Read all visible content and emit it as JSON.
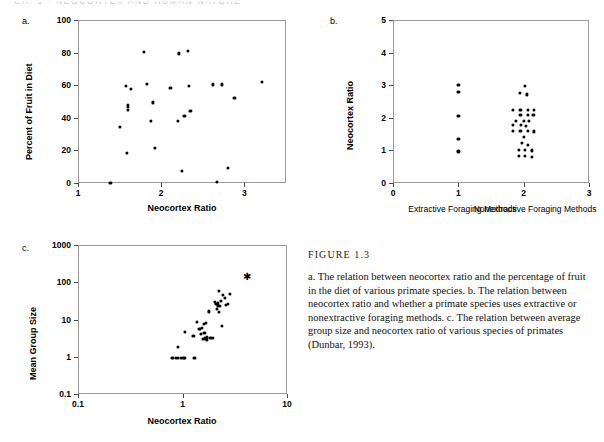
{
  "page_header": "CH. 1 · NEOCORTEX AND HUMAN NATURE",
  "figure": {
    "title": "FIGURE 1.3",
    "caption": "a. The relation between neocortex ratio and the percentage of fruit in the diet of various primate species. b. The relation between neocortex ratio and whether a primate species uses extractive or nonextractive foraging methods. c. The relation between average group size and neocortex ratio of various species of primates (Dunbar, 1993)."
  },
  "panels": {
    "a": {
      "letter": "a."
    },
    "b": {
      "letter": "b."
    },
    "c": {
      "letter": "c."
    }
  },
  "chart_data": [
    {
      "id": "a",
      "type": "scatter",
      "title": "",
      "xlabel": "Neocortex Ratio",
      "ylabel": "Percent of Fruit in Diet",
      "xlim": [
        1,
        3.5
      ],
      "ylim": [
        0,
        100
      ],
      "xscale": "linear",
      "yscale": "linear",
      "xticks": [
        1,
        2,
        3
      ],
      "xticklabels": [
        "1",
        "2",
        "3"
      ],
      "yticks": [
        0,
        20,
        40,
        60,
        80,
        100
      ],
      "yticklabels": [
        "0",
        "20",
        "40",
        "60",
        "80",
        "100"
      ],
      "grid": false,
      "legend": null,
      "points": [
        [
          1.39,
          0.0
        ],
        [
          1.5,
          34.5
        ],
        [
          1.58,
          59.5
        ],
        [
          1.59,
          18.5
        ],
        [
          1.6,
          48.0
        ],
        [
          1.6,
          46.5
        ],
        [
          1.6,
          45.0
        ],
        [
          1.64,
          57.5
        ],
        [
          1.79,
          80.5
        ],
        [
          1.83,
          61.0
        ],
        [
          1.88,
          38.0
        ],
        [
          1.9,
          49.5
        ],
        [
          1.92,
          21.5
        ],
        [
          2.11,
          58.5
        ],
        [
          2.2,
          38.0
        ],
        [
          2.21,
          79.5
        ],
        [
          2.25,
          7.5
        ],
        [
          2.28,
          41.0
        ],
        [
          2.32,
          81.0
        ],
        [
          2.35,
          44.0
        ],
        [
          2.33,
          59.5
        ],
        [
          2.62,
          60.5
        ],
        [
          2.67,
          0.8
        ],
        [
          2.73,
          60.5
        ],
        [
          2.8,
          9.5
        ],
        [
          2.88,
          52.0
        ],
        [
          3.21,
          62.0
        ]
      ]
    },
    {
      "id": "b",
      "type": "scatter",
      "title": "",
      "xlabel": "",
      "ylabel": "Neocortex Ratio",
      "xlim": [
        0,
        3
      ],
      "ylim": [
        0,
        5
      ],
      "xscale": "linear",
      "yscale": "linear",
      "xticks": [
        0,
        1,
        2,
        3
      ],
      "xticklabels": [
        "0",
        "1",
        "2",
        "3"
      ],
      "yticks": [
        0,
        1,
        2,
        3,
        4,
        5
      ],
      "yticklabels": [
        "0",
        "1",
        "2",
        "3",
        "4",
        "5"
      ],
      "grid": false,
      "legend": null,
      "categories": [
        "Extractive Foraging Methods",
        "Nonextractive Foraging Methods"
      ],
      "category_positions": [
        1,
        2
      ],
      "points": [
        [
          1.0,
          3.0
        ],
        [
          1.0,
          2.8
        ],
        [
          1.0,
          2.05
        ],
        [
          1.0,
          1.35
        ],
        [
          1.0,
          0.97
        ],
        [
          2.02,
          2.98
        ],
        [
          1.94,
          2.77
        ],
        [
          2.05,
          2.72
        ],
        [
          1.83,
          2.25
        ],
        [
          1.95,
          2.25
        ],
        [
          2.06,
          2.25
        ],
        [
          2.16,
          2.25
        ],
        [
          1.95,
          2.1
        ],
        [
          2.06,
          2.1
        ],
        [
          2.15,
          2.08
        ],
        [
          1.88,
          1.9
        ],
        [
          2.0,
          1.9
        ],
        [
          2.08,
          1.9
        ],
        [
          1.83,
          1.78
        ],
        [
          1.96,
          1.78
        ],
        [
          2.04,
          1.76
        ],
        [
          1.83,
          1.6
        ],
        [
          1.95,
          1.6
        ],
        [
          2.06,
          1.6
        ],
        [
          2.16,
          1.58
        ],
        [
          2.0,
          1.42
        ],
        [
          1.97,
          1.22
        ],
        [
          2.06,
          1.18
        ],
        [
          1.93,
          1.02
        ],
        [
          2.02,
          1.02
        ],
        [
          2.12,
          1.0
        ],
        [
          1.93,
          0.82
        ],
        [
          2.02,
          0.82
        ],
        [
          2.12,
          0.8
        ]
      ]
    },
    {
      "id": "c",
      "type": "scatter",
      "title": "",
      "xlabel": "Neocortex Ratio",
      "ylabel": "Mean Group Size",
      "xlim": [
        0.1,
        10
      ],
      "ylim": [
        0.1,
        1000
      ],
      "xscale": "log",
      "yscale": "log",
      "xticks": [
        0.1,
        1,
        10
      ],
      "xticklabels": [
        "0.1",
        "1",
        "10"
      ],
      "yticks": [
        0.1,
        1,
        10,
        100,
        1000
      ],
      "yticklabels": [
        "0.1",
        "1",
        "10",
        "100",
        "1000"
      ],
      "grid": false,
      "legend": null,
      "points": [
        [
          0.8,
          0.92
        ],
        [
          0.86,
          0.92
        ],
        [
          0.9,
          0.92
        ],
        [
          0.96,
          0.92
        ],
        [
          1.02,
          0.92
        ],
        [
          1.06,
          0.92
        ],
        [
          1.3,
          0.92
        ],
        [
          0.9,
          1.85
        ],
        [
          1.05,
          4.6
        ],
        [
          1.27,
          3.6
        ],
        [
          1.38,
          8.8
        ],
        [
          1.45,
          5.6
        ],
        [
          1.5,
          4.2
        ],
        [
          1.52,
          6.0
        ],
        [
          1.56,
          3.0
        ],
        [
          1.6,
          7.8
        ],
        [
          1.62,
          4.3
        ],
        [
          1.64,
          3.1
        ],
        [
          1.66,
          8.0
        ],
        [
          1.7,
          3.3
        ],
        [
          1.72,
          2.9
        ],
        [
          1.8,
          16.5
        ],
        [
          1.85,
          3.2
        ],
        [
          1.95,
          3.2
        ],
        [
          2.05,
          30.0
        ],
        [
          2.1,
          26.0
        ],
        [
          2.15,
          19.0
        ],
        [
          2.18,
          24.0
        ],
        [
          2.2,
          28.0
        ],
        [
          2.22,
          16.0
        ],
        [
          2.25,
          60.0
        ],
        [
          2.3,
          23.0
        ],
        [
          2.35,
          32.0
        ],
        [
          2.4,
          6.8
        ],
        [
          2.45,
          45.0
        ],
        [
          2.55,
          38.0
        ],
        [
          2.62,
          25.0
        ],
        [
          2.72,
          26.0
        ],
        [
          2.85,
          48.0
        ]
      ],
      "highlight_points": [
        {
          "x": 4.1,
          "y": 135,
          "marker": "star"
        }
      ]
    }
  ]
}
